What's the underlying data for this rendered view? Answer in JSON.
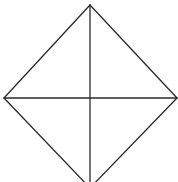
{
  "diagram": {
    "type": "rhombus-with-diagonals",
    "stroke_color": "#2a2a2a",
    "background": "#ffffff",
    "vertices": {
      "top": [
        90,
        5
      ],
      "left": [
        4,
        98
      ],
      "right": [
        177,
        98
      ],
      "bottom": [
        90,
        188
      ]
    },
    "center": [
      90,
      98
    ]
  }
}
